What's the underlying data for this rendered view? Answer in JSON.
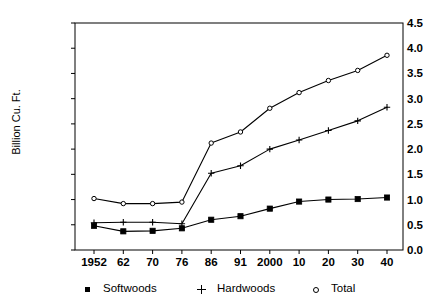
{
  "chart_data": {
    "type": "line",
    "title": "",
    "xlabel": "",
    "ylabel": "Billion Cu. Ft.",
    "categories": [
      "1952",
      "62",
      "70",
      "76",
      "86",
      "91",
      "2000",
      "10",
      "20",
      "30",
      "40"
    ],
    "ylim": [
      0.0,
      4.5
    ],
    "yticks": [
      "0.0",
      "0.5",
      "1.0",
      "1.5",
      "2.0",
      "2.5",
      "3.0",
      "3.5",
      "4.0",
      "4.5"
    ],
    "ytick_values": [
      0.0,
      0.5,
      1.0,
      1.5,
      2.0,
      2.5,
      3.0,
      3.5,
      4.0,
      4.5
    ],
    "grid": false,
    "legend_position": "bottom",
    "series": [
      {
        "name": "Softwoods",
        "marker": "filled-square",
        "color": "#000000",
        "values": [
          0.48,
          0.37,
          0.38,
          0.43,
          0.6,
          0.67,
          0.82,
          0.96,
          1.0,
          1.01,
          1.04
        ]
      },
      {
        "name": "Hardwoods",
        "marker": "plus",
        "color": "#000000",
        "values": [
          0.54,
          0.55,
          0.55,
          0.52,
          1.52,
          1.67,
          2.0,
          2.18,
          2.37,
          2.56,
          2.83
        ]
      },
      {
        "name": "Total",
        "marker": "open-circle",
        "color": "#000000",
        "values": [
          1.02,
          0.92,
          0.92,
          0.95,
          2.12,
          2.34,
          2.81,
          3.12,
          3.36,
          3.56,
          3.86
        ]
      }
    ]
  },
  "plot": {
    "left": 75,
    "right": 403,
    "top": 23,
    "bottom": 250,
    "first_tick_x": 94,
    "last_tick_x": 387
  },
  "legend": {
    "items": [
      {
        "label": "Softwoods",
        "marker": "filled-square",
        "x": 82
      },
      {
        "label": "Hardwoods",
        "marker": "plus",
        "x": 196
      },
      {
        "label": "Total",
        "marker": "open-circle",
        "x": 310
      }
    ]
  }
}
